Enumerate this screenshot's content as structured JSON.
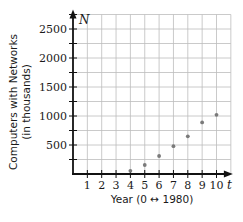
{
  "chart_data": {
    "type": "scatter",
    "title": "",
    "xlabel": "Year (0 ↔ 1980)",
    "ylabel_line1": "Computers with Networks",
    "ylabel_line2": "(in thousands)",
    "x_var": "t",
    "y_var": "N",
    "xlim": [
      0,
      11
    ],
    "ylim": [
      0,
      2750
    ],
    "x_ticks": [
      1,
      2,
      3,
      4,
      5,
      6,
      7,
      8,
      9,
      10
    ],
    "y_ticks": [
      500,
      1000,
      1500,
      2000,
      2500
    ],
    "y_minor_step": 250,
    "grid": true,
    "legend": null,
    "x": [
      4,
      5,
      6,
      7,
      8,
      9,
      10
    ],
    "y": [
      55,
      155,
      310,
      480,
      650,
      890,
      1020
    ],
    "colors": {
      "grid": "#bdbdbd",
      "axis": "#111111",
      "point": "#7a7a7a"
    }
  }
}
